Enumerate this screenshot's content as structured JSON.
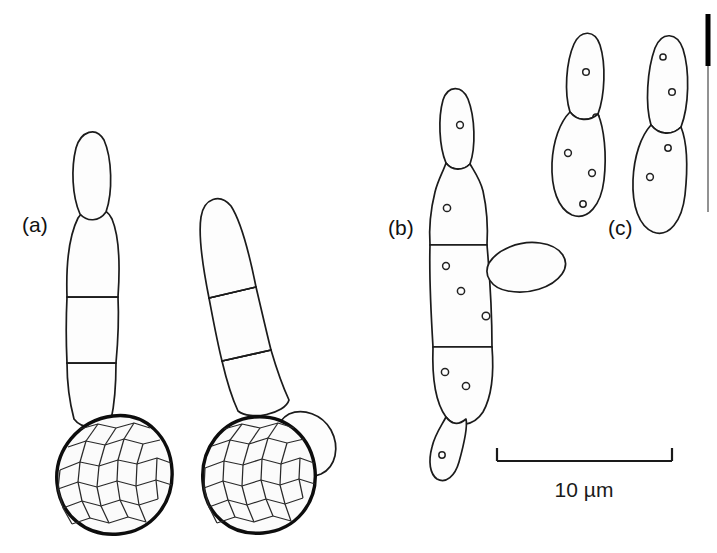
{
  "figure": {
    "kind": "scientific-line-drawing",
    "background_color": "#ffffff",
    "ink_color": "#1b1b1b",
    "panels": [
      {
        "id": "a",
        "label": "(a)",
        "label_x": 22,
        "label_y": 232,
        "description": "two germinating ornamented spores with septate germ tubes"
      },
      {
        "id": "b",
        "label": "(b)",
        "label_x": 388,
        "label_y": 235,
        "description": "septate cell chain with lateral bud and apical cells"
      },
      {
        "id": "c",
        "label": "(c)",
        "label_x": 608,
        "label_y": 235,
        "description": "two detached two-celled budding chains"
      }
    ],
    "scale_bar": {
      "label": "10 µm",
      "label_x": 584,
      "label_y": 497,
      "x1": 497,
      "x2": 672,
      "y": 461,
      "tick_height": 13
    },
    "edge_bar": {
      "x": 708,
      "thick_y1": 14,
      "thick_y2": 66,
      "thin_y1": 66,
      "thin_y2": 212,
      "thick_color": "#000000",
      "thin_color": "#777777"
    },
    "stipple": {
      "dot_color": "#3a3a3a",
      "dot_radius": 0.62,
      "density": "fine"
    }
  }
}
